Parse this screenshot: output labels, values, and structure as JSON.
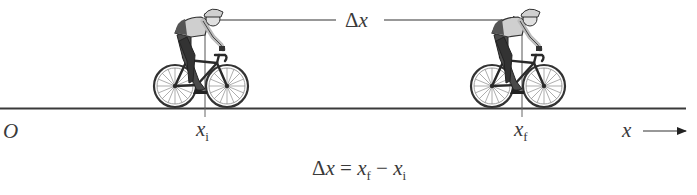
{
  "diagram": {
    "origin_label": "O",
    "axis_label": "x",
    "initial_position": {
      "symbol": "x",
      "subscript": "i"
    },
    "final_position": {
      "symbol": "x",
      "subscript": "f"
    },
    "displacement_label": {
      "delta": "Δ",
      "symbol": "x"
    },
    "equation": {
      "lhs_delta": "Δ",
      "lhs_symbol": "x",
      "equals": "=",
      "term1_symbol": "x",
      "term1_sub": "f",
      "minus": "−",
      "term2_symbol": "x",
      "term2_sub": "i"
    },
    "figures": [
      "cyclist at initial position",
      "cyclist at final position"
    ],
    "colors": {
      "line": "#3a3a3a",
      "background": "#ffffff",
      "rider_skin": "#d9d9d9",
      "rider_dark": "#444444"
    }
  }
}
